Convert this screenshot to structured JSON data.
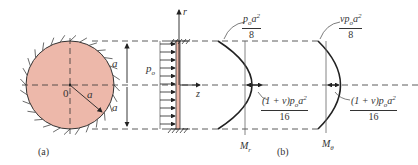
{
  "figure": {
    "panel_a": {
      "label": "(a)",
      "center_label": "0",
      "radius_label": "a",
      "dim_top": "a",
      "dim_bottom": "a",
      "fill_color": "#edb8aa"
    },
    "panel_b": {
      "label": "(b)",
      "pressure_label_base": "p",
      "pressure_label_sub": "o",
      "axis_r": "r",
      "axis_z": "z",
      "mr": {
        "label_base": "M",
        "label_sub": "r",
        "edge_num": "p",
        "edge_num_sub": "o",
        "edge_num_tail": "a",
        "edge_num_sup": "2",
        "edge_den": "8",
        "center_num_pre": "(1 + ν)p",
        "center_num_sub": "o",
        "center_num_tail": "a",
        "center_num_sup": "2",
        "center_den": "16"
      },
      "mtheta": {
        "label_base": "M",
        "label_sub": "θ",
        "edge_num_pre": "νp",
        "edge_num_sub": "o",
        "edge_num_tail": "a",
        "edge_num_sup": "2",
        "edge_den": "8",
        "center_num_pre": "(1 + ν)p",
        "center_num_sub": "o",
        "center_num_tail": "a",
        "center_num_sup": "2",
        "center_den": "16"
      }
    }
  }
}
